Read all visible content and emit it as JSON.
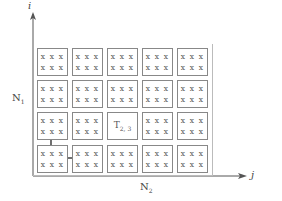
{
  "diagram": {
    "axes": {
      "vertical_label": "i",
      "horizontal_label": "j",
      "vertical_extent_label": "N",
      "vertical_extent_sub": "1",
      "horizontal_extent_label": "N",
      "horizontal_extent_sub": "2"
    },
    "grid": {
      "rows": 4,
      "cols": 5,
      "cell_row_text": "x x x",
      "highlight_tile": {
        "row": 2,
        "col": 2,
        "label": "T",
        "subscript": "2, 3"
      }
    },
    "colors": {
      "axis": "#555555",
      "tile_border": "#888888",
      "arrow": "#222222",
      "text": "#555555"
    }
  }
}
